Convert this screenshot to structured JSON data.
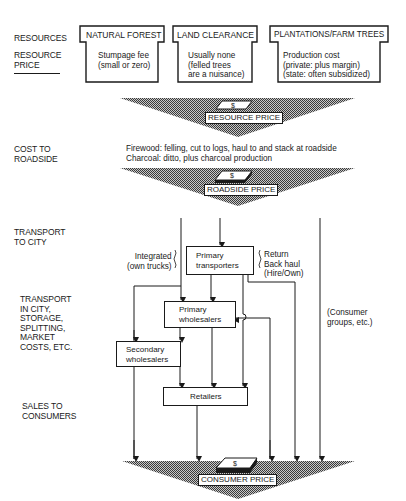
{
  "row_labels": {
    "resources": "RESOURCES",
    "resource_price": "RESOURCE\nPRICE",
    "cost_to_roadside": "COST TO\nROADSIDE",
    "transport_to_city": "TRANSPORT\nTO CITY",
    "transport_in_city": "TRANSPORT\nIN CITY,\nSTORAGE,\nSPLITTING,\nMARKET\nCOSTS, ETC.",
    "sales_to_consumers": "SALES TO\nCONSUMERS"
  },
  "resources": [
    {
      "title": "NATURAL FOREST",
      "price": "Stumpage fee\n(small or zero)"
    },
    {
      "title": "LAND CLEARANCE",
      "price": "Usually none\n(felled trees\nare a nuisance)"
    },
    {
      "title": "PLANTATIONS/FARM TREES",
      "price": "Production cost\n(private: plus margin)\n(state: often subsidized)"
    }
  ],
  "price_stages": {
    "resource_price": "RESOURCE PRICE",
    "roadside_price": "ROADSIDE PRICE",
    "consumer_price": "CONSUMER PRICE",
    "icon": "dollar-bill-icon"
  },
  "roadside_costs": "Firewood: felling, cut to logs, haul to and stack at roadside\nCharcoal: ditto, plus charcoal production",
  "flow": {
    "integrated": "Integrated\n(own trucks)",
    "primary_transporters": "Primary\ntransporters",
    "return": "Return\nBack haul\n(Hire/Own)",
    "primary_wholesalers": "Primary\nwholesalers",
    "secondary_wholesalers": "Secondary\nwholesalers",
    "retailers": "Retailers",
    "consumer_groups": "(Consumer\ngroups, etc.)"
  },
  "colors": {
    "ink": "#1a1a1a",
    "shade": "#8a8a8a",
    "background": "#ffffff"
  }
}
